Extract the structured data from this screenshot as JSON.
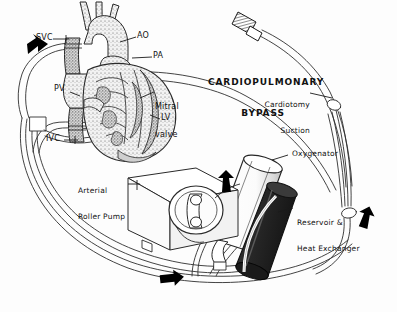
{
  "figure": {
    "title_line1": "CARDIOPULMONARY",
    "title_line2": "BYPASS",
    "background_color": "#fdfdfd",
    "ink_color": "#111111",
    "tube_outline_color": "#2b2b2b",
    "reservoir_fill_color": "#2e2e2e",
    "oxygenator_fill_color": "#ffffff",
    "arrow_fill_color": "#000000"
  },
  "anatomy_labels": [
    {
      "id": "svc",
      "text": "SVC",
      "desc": "superior-vena-cava"
    },
    {
      "id": "ao",
      "text": "AO",
      "desc": "aorta"
    },
    {
      "id": "pa",
      "text": "PA",
      "desc": "pulmonary-artery"
    },
    {
      "id": "pv",
      "text": "PV",
      "desc": "pulmonary-vein"
    },
    {
      "id": "ivc",
      "text": "IVC",
      "desc": "inferior-vena-cava"
    },
    {
      "id": "lv",
      "text": "LV",
      "desc": "left-ventricle"
    },
    {
      "id": "mitral_l1",
      "text": "Mitral",
      "desc": "mitral-valve-line-1"
    },
    {
      "id": "mitral_l2",
      "text": "valve",
      "desc": "mitral-valve-line-2"
    }
  ],
  "component_labels": [
    {
      "id": "cardiotomy_l1",
      "text": "Cardiotomy",
      "desc": "cardiotomy-suction-line-1"
    },
    {
      "id": "cardiotomy_l2",
      "text": "Suction",
      "desc": "cardiotomy-suction-line-2"
    },
    {
      "id": "oxygenator",
      "text": "Oxygenator",
      "desc": "oxygenator"
    },
    {
      "id": "reservoir_l1",
      "text": "Reservoir &",
      "desc": "reservoir-line-1"
    },
    {
      "id": "reservoir_l2",
      "text": "Heat Exchanger",
      "desc": "reservoir-line-2"
    },
    {
      "id": "pump_l1",
      "text": "Arterial",
      "desc": "arterial-roller-pump-line-1"
    },
    {
      "id": "pump_l2",
      "text": "Roller Pump",
      "desc": "arterial-roller-pump-line-2"
    }
  ],
  "flow_arrows": [
    {
      "id": "arrow_venous_left",
      "direction": "down-left",
      "desc": "venous-drainage-flow"
    },
    {
      "id": "arrow_pump_outlet",
      "direction": "up",
      "desc": "oxygenated-flow-to-oxygenator"
    },
    {
      "id": "arrow_arterial_right",
      "direction": "down",
      "desc": "arterial-return-flow"
    },
    {
      "id": "arrow_bottom",
      "direction": "right",
      "desc": "arterial-line-flow"
    }
  ]
}
